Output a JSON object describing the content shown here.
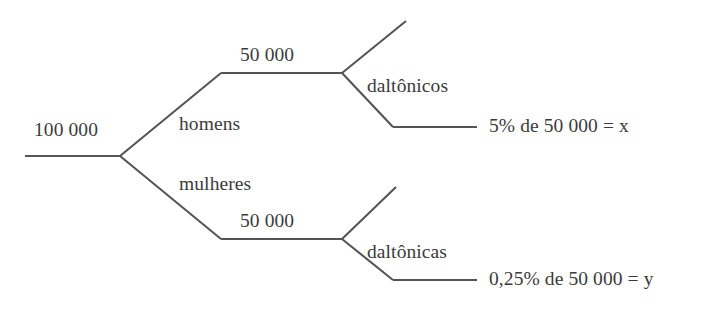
{
  "diagram": {
    "type": "probability-tree",
    "language": "pt-BR",
    "line_color": "#555556",
    "text_color": "#3b3b3b",
    "background_color": "#ffffff",
    "root": {
      "label": "100 000",
      "name": "population-total"
    },
    "branches": [
      {
        "name": "homens",
        "edge_label": "homens",
        "value_label": "50 000",
        "leaves": [
          {
            "name": "unlabeled-upper",
            "label": ""
          },
          {
            "name": "daltonicos",
            "label": "daltônicos",
            "result": "5% de 50 000 = x"
          }
        ]
      },
      {
        "name": "mulheres",
        "edge_label": "mulheres",
        "value_label": "50 000",
        "leaves": [
          {
            "name": "unlabeled-lower",
            "label": ""
          },
          {
            "name": "daltonicas",
            "label": "daltônicas",
            "result": "0,25% de 50 000 = y"
          }
        ]
      }
    ],
    "labels": {
      "root_total": "100 000",
      "homens": "homens",
      "mulheres": "mulheres",
      "homens_total": "50 000",
      "mulheres_total": "50 000",
      "daltonicos": "daltônicos",
      "daltonicas": "daltônicas",
      "result_x": "5% de 50 000 = x",
      "result_y": "0,25% de 50 000 = y"
    }
  }
}
